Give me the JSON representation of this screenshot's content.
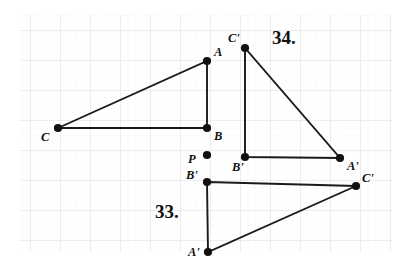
{
  "figure": {
    "canvas": {
      "width": 415,
      "height": 275
    },
    "background_color": "#ffffff",
    "ink_color": "#111111",
    "grid": {
      "visible": true,
      "minor_spacing": 7.5,
      "major_spacing": 30,
      "minor_color": "#eeeeee",
      "major_color": "#e2e2e2",
      "origin_x": 20,
      "origin_y": 15,
      "extent_x": 392,
      "extent_y": 252
    }
  },
  "problems": [
    {
      "id": "problem-33",
      "number_label": "33.",
      "number_x": 155,
      "number_y": 218
    },
    {
      "id": "problem-34",
      "number_label": "34.",
      "number_x": 272,
      "number_y": 44
    }
  ],
  "points": [
    {
      "id": "A",
      "label": "A",
      "x": 207,
      "y": 61,
      "label_x": 214,
      "label_y": 56,
      "group": "preimage"
    },
    {
      "id": "B",
      "label": "B",
      "x": 207,
      "y": 128,
      "label_x": 214,
      "label_y": 140,
      "group": "preimage"
    },
    {
      "id": "C",
      "label": "C",
      "x": 58,
      "y": 128,
      "label_x": 41,
      "label_y": 141,
      "group": "preimage"
    },
    {
      "id": "P",
      "label": "P",
      "x": 207,
      "y": 155,
      "label_x": 188,
      "label_y": 163,
      "group": "center"
    },
    {
      "id": "C34",
      "label": "C'",
      "x": 245,
      "y": 48,
      "label_x": 228,
      "label_y": 42,
      "group": "image-34"
    },
    {
      "id": "B34",
      "label": "B'",
      "x": 245,
      "y": 157,
      "label_x": 232,
      "label_y": 171,
      "group": "image-34"
    },
    {
      "id": "A34",
      "label": "A'",
      "x": 340,
      "y": 158,
      "label_x": 347,
      "label_y": 170,
      "group": "image-34"
    },
    {
      "id": "B33",
      "label": "B'",
      "x": 207,
      "y": 182,
      "label_x": 186,
      "label_y": 179,
      "group": "image-33"
    },
    {
      "id": "C33",
      "label": "C'",
      "x": 356,
      "y": 186,
      "label_x": 362,
      "label_y": 182,
      "group": "image-33"
    },
    {
      "id": "A33",
      "label": "A'",
      "x": 208,
      "y": 252,
      "label_x": 188,
      "label_y": 256,
      "group": "image-33"
    }
  ],
  "triangles": [
    {
      "id": "triangle-ABC",
      "name": "preimage triangle ABC",
      "vertices": [
        "A",
        "B",
        "C"
      ],
      "path": "M 207 61 L 207 128 L 58 128 Z"
    },
    {
      "id": "triangle-34-image",
      "name": "image triangle A'B'C' for problem 34",
      "vertices": [
        "C34",
        "B34",
        "A34"
      ],
      "path": "M 245 48 L 245 157 L 340 158 Z"
    },
    {
      "id": "triangle-33-image",
      "name": "image triangle A'B'C' for problem 33",
      "vertices": [
        "B33",
        "C33",
        "A33"
      ],
      "path": "M 207 182 L 356 186 L 208 252 Z"
    }
  ],
  "dot_radius": 4.1
}
